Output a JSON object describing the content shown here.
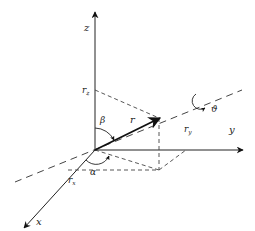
{
  "diagram": {
    "axes": {
      "x": {
        "label": "x"
      },
      "y": {
        "label": "y"
      },
      "z": {
        "label": "z"
      }
    },
    "vector": {
      "label": "r"
    },
    "components": {
      "rx": {
        "label": "r",
        "sub": "x"
      },
      "ry": {
        "label": "r",
        "sub": "y"
      },
      "rz": {
        "label": "r",
        "sub": "z"
      }
    },
    "angles": {
      "alpha": {
        "label": "α"
      },
      "beta": {
        "label": "β"
      },
      "theta": {
        "label": "ϑ"
      }
    },
    "colors": {
      "line": "#222222",
      "dashed": "#444444",
      "background": "#ffffff"
    }
  }
}
